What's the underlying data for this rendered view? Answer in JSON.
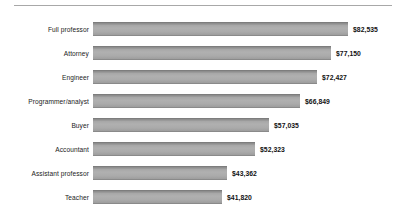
{
  "chart_data": {
    "type": "bar",
    "orientation": "horizontal",
    "title": "",
    "subtitle": "",
    "xlabel": "",
    "ylabel": "",
    "grid": false,
    "legend": null,
    "axis_visible": false,
    "xlim": [
      0,
      82535
    ],
    "categories": [
      "Full professor",
      "Attorney",
      "Engineer",
      "Programmer/analyst",
      "Buyer",
      "Accountant",
      "Assistant professor",
      "Teacher"
    ],
    "values": [
      82535,
      77150,
      72427,
      66849,
      57035,
      52323,
      43362,
      41820
    ],
    "value_labels": [
      "$82,535",
      "$77,150",
      "$72,427",
      "$66,849",
      "$57,035",
      "$52,323",
      "$43,362",
      "$41,820"
    ],
    "bars": [
      {
        "category": "Full professor",
        "value": 82535,
        "label": "$82,535"
      },
      {
        "category": "Attorney",
        "value": 77150,
        "label": "$77,150"
      },
      {
        "category": "Engineer",
        "value": 72427,
        "label": "$72,427"
      },
      {
        "category": "Programmer/analyst",
        "value": 66849,
        "label": "$66,849"
      },
      {
        "category": "Buyer",
        "value": 57035,
        "label": "$57,035"
      },
      {
        "category": "Accountant",
        "value": 52323,
        "label": "$52,323"
      },
      {
        "category": "Assistant professor",
        "value": 43362,
        "label": "$43,362"
      },
      {
        "category": "Teacher",
        "value": 41820,
        "label": "$41,820"
      }
    ],
    "colors": {
      "bar_fill": "#aaaaaa",
      "bar_edge": "#7d7d7d",
      "text": "#1b1b1b",
      "value_text": "#111111",
      "rule": "#a8a8a8",
      "background": "#ffffff"
    }
  }
}
